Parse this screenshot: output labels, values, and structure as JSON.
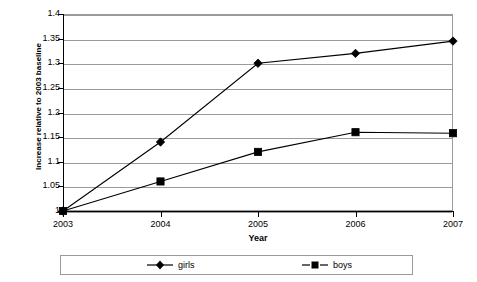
{
  "chart_data": {
    "type": "line",
    "title": "",
    "xlabel": "Year",
    "ylabel": "Increase relative to 2003 baseline",
    "categories": [
      "2003",
      "2004",
      "2005",
      "2006",
      "2007"
    ],
    "series": [
      {
        "name": "girls",
        "marker": "diamond",
        "values": [
          1,
          1.14,
          1.3,
          1.32,
          1.345
        ]
      },
      {
        "name": "boys",
        "marker": "square",
        "values": [
          1,
          1.06,
          1.12,
          1.16,
          1.158
        ]
      }
    ],
    "ylim": [
      1,
      1.4
    ],
    "ytick_labels": [
      "1.4",
      "1.35",
      "1.3",
      "1.25",
      "1.2",
      "1.15",
      "1.1",
      "1.05",
      "1"
    ],
    "ytick_values": [
      1.4,
      1.35,
      1.3,
      1.25,
      1.2,
      1.15,
      1.1,
      1.05,
      1
    ],
    "grid": true,
    "legend_position": "bottom",
    "colors": {
      "series": "#000000",
      "grid": "#9a9a9a",
      "axis": "#000000",
      "background": "#ffffff"
    }
  }
}
